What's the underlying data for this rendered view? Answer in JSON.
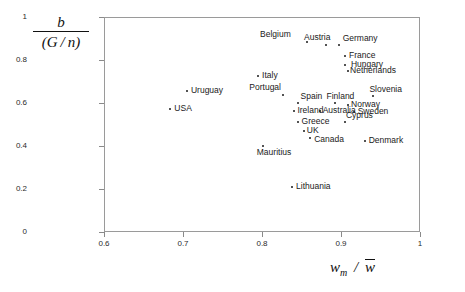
{
  "chart_data": {
    "type": "scatter",
    "title": "",
    "xlabel": "w_m / w̄",
    "ylabel": "b / (G / n)",
    "xlim": [
      0.6,
      1.0
    ],
    "ylim": [
      0.0,
      1.0
    ],
    "grid": false,
    "legend": null,
    "xticks": [
      "0.6",
      "0.7",
      "0.8",
      "0.9",
      "1"
    ],
    "xtick_values": [
      0.6,
      0.7,
      0.8,
      0.9,
      1.0
    ],
    "yticks": [
      "0",
      "0.2",
      "0.4",
      "0.6",
      "0.8",
      "1"
    ],
    "ytick_values": [
      0,
      0.2,
      0.4,
      0.6,
      0.8,
      1.0
    ],
    "points": [
      {
        "label": "Belgium",
        "x": 0.857,
        "y": 0.884,
        "label_dx": -47,
        "label_dy": -12
      },
      {
        "label": "Austria",
        "x": 0.881,
        "y": 0.87,
        "label_dx": -22,
        "label_dy": -12
      },
      {
        "label": "Germany",
        "x": 0.897,
        "y": 0.87,
        "label_dx": 4,
        "label_dy": -11
      },
      {
        "label": "France",
        "x": 0.905,
        "y": 0.819,
        "label_dx": 4,
        "label_dy": -5
      },
      {
        "label": "Hungary",
        "x": 0.905,
        "y": 0.777,
        "label_dx": 6,
        "label_dy": -5
      },
      {
        "label": "Netherlands",
        "x": 0.909,
        "y": 0.749,
        "label_dx": 2,
        "label_dy": -5
      },
      {
        "label": "Italy",
        "x": 0.795,
        "y": 0.726,
        "label_dx": 4,
        "label_dy": -5
      },
      {
        "label": "Uruguay",
        "x": 0.705,
        "y": 0.656,
        "label_dx": 4,
        "label_dy": -5
      },
      {
        "label": "Portugal",
        "x": 0.827,
        "y": 0.637,
        "label_dx": -34,
        "label_dy": -12
      },
      {
        "label": "Slovenia",
        "x": 0.941,
        "y": 0.633,
        "label_dx": -4,
        "label_dy": -11
      },
      {
        "label": "Spain",
        "x": 0.845,
        "y": 0.6,
        "label_dx": 3,
        "label_dy": -11
      },
      {
        "label": "Finland",
        "x": 0.893,
        "y": 0.6,
        "label_dx": -9,
        "label_dy": -11
      },
      {
        "label": "Norway",
        "x": 0.909,
        "y": 0.591,
        "label_dx": 3,
        "label_dy": -5
      },
      {
        "label": "USA",
        "x": 0.684,
        "y": 0.572,
        "label_dx": 4,
        "label_dy": -5
      },
      {
        "label": "Ireland",
        "x": 0.841,
        "y": 0.563,
        "label_dx": 3,
        "label_dy": -5
      },
      {
        "label": "Australia",
        "x": 0.873,
        "y": 0.563,
        "label_dx": 3,
        "label_dy": -5
      },
      {
        "label": "Sweden",
        "x": 0.916,
        "y": 0.558,
        "label_dx": 4,
        "label_dy": -5
      },
      {
        "label": "Greece",
        "x": 0.845,
        "y": 0.512,
        "label_dx": 4,
        "label_dy": -5
      },
      {
        "label": "Cyprus",
        "x": 0.905,
        "y": 0.512,
        "label_dx": 1,
        "label_dy": -11
      },
      {
        "label": "UK",
        "x": 0.853,
        "y": 0.47,
        "label_dx": 3,
        "label_dy": -5
      },
      {
        "label": "Canada",
        "x": 0.861,
        "y": 0.437,
        "label_dx": 4,
        "label_dy": -3
      },
      {
        "label": "Denmark",
        "x": 0.93,
        "y": 0.423,
        "label_dx": 4,
        "label_dy": -5
      },
      {
        "label": "Mauritius",
        "x": 0.801,
        "y": 0.4,
        "label_dx": -6,
        "label_dy": 2
      },
      {
        "label": "Lithuania",
        "x": 0.838,
        "y": 0.209,
        "label_dx": 4,
        "label_dy": -5
      }
    ]
  }
}
